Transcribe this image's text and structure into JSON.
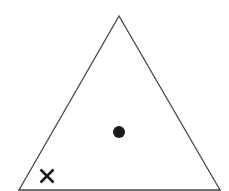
{
  "diagram": {
    "type": "triangle-with-markers",
    "background": "#ffffff",
    "stroke_color": "#444444",
    "triangle": {
      "vertices": [
        [
          119,
          16
        ],
        [
          19,
          190
        ],
        [
          220,
          190
        ]
      ],
      "stroke_width": 1.3,
      "fill": "#ffffff"
    },
    "markers": [
      {
        "kind": "dot",
        "label": "●",
        "cx": 119,
        "cy": 132,
        "r": 6,
        "color": "#1a1a1a"
      },
      {
        "kind": "cross",
        "label": "×",
        "cx": 47,
        "cy": 176,
        "half_size": 6.5,
        "stroke_width": 2.5,
        "color": "#1a1a1a"
      }
    ]
  }
}
